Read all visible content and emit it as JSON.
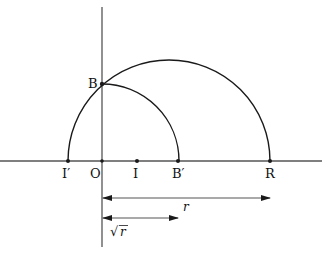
{
  "diagram": {
    "colors": {
      "ink": "#1a1a1a",
      "axis": "#555555",
      "background": "#ffffff"
    },
    "points": {
      "I_prime": "I′",
      "O": "O",
      "I": "I",
      "B_prime": "B′",
      "R": "R",
      "B": "B"
    },
    "dimensions": {
      "r_label": "r",
      "sqrt_r_symbol": "√",
      "sqrt_r_var": "r"
    },
    "elements": [
      "horizontal axis",
      "vertical axis through O",
      "semicircle on diameter I′R",
      "quarter circle centered at O through B and B′",
      "dimension arrow O to R labeled r",
      "dimension arrow O to B′ labeled √r"
    ]
  }
}
